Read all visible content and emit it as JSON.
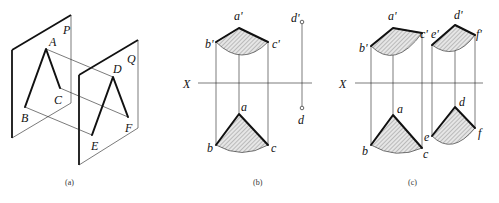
{
  "figure": {
    "panels": [
      {
        "id": "a",
        "caption": "(a)",
        "description": "Two parallel planes P and Q with lines AB, AC in plane P and DE, DF in plane Q; projection lines connect A–D, B–E, C–F",
        "plane_labels": [
          "P",
          "Q"
        ],
        "point_labels": [
          "A",
          "B",
          "C",
          "D",
          "E",
          "F"
        ]
      },
      {
        "id": "b",
        "caption": "(b)",
        "axis_label": "X",
        "point_labels": [
          "a'",
          "b'",
          "c'",
          "d'",
          "a",
          "b",
          "c",
          "d"
        ]
      },
      {
        "id": "c",
        "caption": "(c)",
        "axis_label": "X",
        "point_labels": [
          "a'",
          "b'",
          "c'",
          "e'",
          "d'",
          "f'",
          "a",
          "b",
          "c",
          "e",
          "d",
          "f"
        ]
      }
    ]
  },
  "labels": {
    "a": {
      "P": "P",
      "Q": "Q",
      "A": "A",
      "B": "B",
      "C": "C",
      "D": "D",
      "E": "E",
      "F": "F",
      "caption": "(a)"
    },
    "b": {
      "a1": "a'",
      "b1": "b'",
      "c1": "c'",
      "d1": "d'",
      "X": "X",
      "a": "a",
      "b": "b",
      "c": "c",
      "d": "d",
      "caption": "(b)"
    },
    "c": {
      "a1": "a'",
      "b1": "b'",
      "c1": "c'",
      "e1": "e'",
      "d1": "d'",
      "f1": "f'",
      "X": "X",
      "a": "a",
      "b": "b",
      "c": "c",
      "e": "e",
      "d": "d",
      "f": "f",
      "caption": "(c)"
    }
  }
}
